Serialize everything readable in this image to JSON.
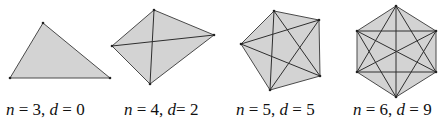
{
  "figure": {
    "fill_color": "#d3d3d3",
    "stroke_color": "#4a4a4a",
    "panels": [
      {
        "id": "triangle",
        "n": "3",
        "d": "0",
        "label": {
          "n_var": "n",
          "eq1": " = 3, ",
          "d_var": "d",
          "eq2": " = 0"
        },
        "vertices": [
          [
            10,
            78
          ],
          [
            43,
            23
          ],
          [
            110,
            78
          ]
        ],
        "label_x": 6
      },
      {
        "id": "quadrilateral",
        "n": "4",
        "d": "2",
        "label": {
          "n_var": "n",
          "eq1": " = 4, ",
          "d_var": "d",
          "eq2": "= 2"
        },
        "vertices": [
          [
            112,
            46
          ],
          [
            154,
            10
          ],
          [
            214,
            35
          ],
          [
            150,
            84
          ]
        ],
        "label_x": 124
      },
      {
        "id": "pentagon",
        "n": "5",
        "d": "5",
        "label": {
          "n_var": "n",
          "eq1": " = 5, ",
          "d_var": "d",
          "eq2": " = 5"
        },
        "vertices": [
          [
            241,
            44
          ],
          [
            274,
            11
          ],
          [
            319,
            20
          ],
          [
            320,
            76
          ],
          [
            270,
            90
          ]
        ],
        "label_x": 236
      },
      {
        "id": "hexagon",
        "n": "6",
        "d": "9",
        "label": {
          "n_var": "n",
          "eq1": " = 6, ",
          "d_var": "d",
          "eq2": " = 9"
        },
        "vertices": [
          [
            396,
            6
          ],
          [
            436,
            31
          ],
          [
            436,
            72
          ],
          [
            396,
            97
          ],
          [
            357,
            72
          ],
          [
            357,
            31
          ]
        ],
        "label_x": 353
      }
    ]
  }
}
